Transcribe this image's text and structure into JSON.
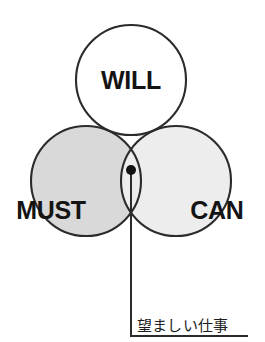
{
  "diagram": {
    "type": "venn-3-circle",
    "title_visible": false,
    "circles": [
      {
        "id": "will",
        "label": "WILL",
        "fill_color": "#ffffff",
        "stroke_color": "#2b2b2b",
        "cx": 131,
        "cy": 80,
        "r": 55,
        "label_x": 131,
        "label_y": 80
      },
      {
        "id": "must",
        "label": "MUST",
        "fill_color": "#d9d9d9",
        "stroke_color": "#2b2b2b",
        "cx": 86,
        "cy": 181,
        "r": 55,
        "label_x": 51,
        "label_y": 210
      },
      {
        "id": "can",
        "label": "CAN",
        "fill_color": "#ededed",
        "stroke_color": "#2b2b2b",
        "cx": 176,
        "cy": 181,
        "r": 55,
        "label_x": 217,
        "label_y": 210
      }
    ],
    "intersection": {
      "id": "triple-overlap",
      "fill_color": "#a2a2a2",
      "marker_x": 131,
      "marker_y": 170,
      "marker_radius": 5,
      "marker_color": "#111111"
    },
    "callout": {
      "text": "望ましい仕事",
      "text_x": 137,
      "text_baseline": 331,
      "leader_color": "#2b2b2b",
      "leader_vertical_x": 131,
      "leader_from_y": 170,
      "leader_to_y": 336,
      "leader_horizontal_to_x": 248
    }
  }
}
